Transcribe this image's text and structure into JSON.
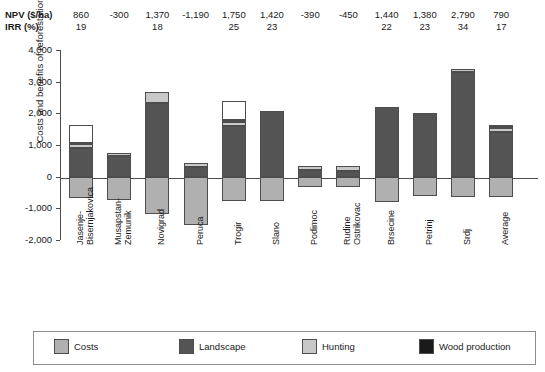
{
  "table": {
    "row_labels": [
      "NPV ($/ha)",
      "IRR (%)"
    ],
    "npv": [
      "860",
      "-300",
      "1,370",
      "-1,190",
      "1,750",
      "1,420",
      "-390",
      "-450",
      "1,440",
      "1,380",
      "2,790",
      "790"
    ],
    "irr": [
      "19",
      "",
      "18",
      "",
      "25",
      "23",
      "",
      "",
      "22",
      "23",
      "34",
      "17"
    ]
  },
  "chart_data": {
    "type": "bar",
    "stacked": true,
    "title": "",
    "xlabel": "",
    "ylabel": "Costs and benefits of reforestation ($/ha)",
    "ylim": [
      -2000,
      4000
    ],
    "yticks": [
      -2000,
      -1000,
      0,
      1000,
      2000,
      3000,
      4000
    ],
    "ytick_labels": [
      "-2,000",
      "-1,000",
      "0",
      "1,000",
      "2,000",
      "3,000",
      "4,000"
    ],
    "grid": false,
    "legend_position": "bottom",
    "categories": [
      "Jasenje-\nBisernjakovica",
      "Musapstan-\nZemunik",
      "Novigrad",
      "Peruca",
      "Trogir",
      "Slano",
      "Podimoc",
      "Rudine\nOstrikovac",
      "Brsecine",
      "Petrinj",
      "Srdj",
      "Average"
    ],
    "category_lines": [
      [
        "Jasenje-",
        "Bisernjakovica"
      ],
      [
        "Musapstan-",
        "Zemunik"
      ],
      [
        "Novigrad"
      ],
      [
        "Peruca"
      ],
      [
        "Trogir"
      ],
      [
        "Slano"
      ],
      [
        "Podimoc"
      ],
      [
        "Rudine",
        "Ostrikovac"
      ],
      [
        "Brsecine"
      ],
      [
        "Petrinj"
      ],
      [
        "Srdj"
      ],
      [
        "Average"
      ]
    ],
    "series": [
      {
        "name": "Costs",
        "color": "#b0b0b0",
        "values": [
          -680,
          -750,
          -1180,
          -1520,
          -760,
          -780,
          -330,
          -330,
          -800,
          -600,
          -630,
          -640
        ]
      },
      {
        "name": "Landscape",
        "color": "#545454",
        "values": [
          900,
          650,
          2330,
          300,
          1600,
          2080,
          200,
          180,
          2200,
          2020,
          3300,
          1420
        ]
      },
      {
        "name": "Hunting",
        "color": "#c8c8c8",
        "values": [
          130,
          90,
          330,
          130,
          120,
          0,
          130,
          170,
          0,
          0,
          100,
          110
        ]
      },
      {
        "name": "Wood production",
        "color": "#1a1a1a",
        "values": [
          30,
          0,
          0,
          0,
          60,
          0,
          0,
          0,
          0,
          0,
          0,
          30
        ]
      },
      {
        "name": "Erosion protection",
        "color": "#ffffff",
        "values": [
          570,
          0,
          0,
          0,
          620,
          0,
          0,
          0,
          0,
          0,
          0,
          80
        ]
      }
    ]
  },
  "legend": {
    "items": [
      {
        "label": "Costs",
        "color": "#b0b0b0"
      },
      {
        "label": "Landscape",
        "color": "#545454"
      },
      {
        "label": "Hunting",
        "color": "#c8c8c8"
      },
      {
        "label": "Wood production",
        "color": "#1a1a1a"
      },
      {
        "label": "Erosion protection",
        "color": "#ffffff"
      }
    ]
  }
}
